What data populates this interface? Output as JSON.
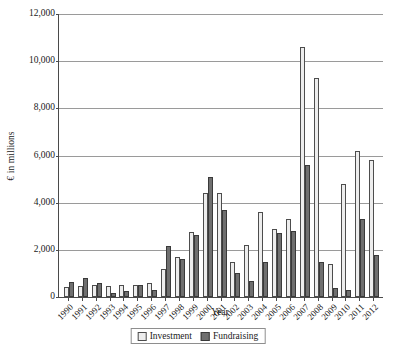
{
  "chart_data": {
    "type": "bar",
    "title": "",
    "xlabel": "Year",
    "ylabel": "€ in millions",
    "ylim": [
      0,
      12000
    ],
    "ytick_step": 2000,
    "yticks": [
      "12,000",
      "10,000",
      "8,000",
      "6,000",
      "4,000",
      "2,000",
      "0"
    ],
    "ytick_values": [
      12000,
      10000,
      8000,
      6000,
      4000,
      2000,
      0
    ],
    "grid": "horizontal",
    "legend_position": "bottom-center",
    "categories": [
      "1990",
      "1991",
      "1992",
      "1993",
      "1994",
      "1995",
      "1996",
      "1997",
      "1998",
      "1999",
      "2000",
      "2001",
      "2002",
      "2003",
      "2004",
      "2005",
      "2006",
      "2007",
      "2008",
      "2009",
      "2010",
      "2011",
      "2012"
    ],
    "series": [
      {
        "name": "Investment",
        "color": "#ededed",
        "values": [
          430,
          480,
          520,
          480,
          520,
          520,
          600,
          1200,
          1700,
          2750,
          4400,
          4400,
          1500,
          2200,
          3600,
          2900,
          3300,
          10600,
          9300,
          1400,
          4800,
          6200,
          5800
        ]
      },
      {
        "name": "Fundraising",
        "color": "#6f6f6f",
        "values": [
          630,
          790,
          600,
          180,
          260,
          520,
          300,
          2150,
          1600,
          2650,
          5100,
          3700,
          1000,
          700,
          1500,
          2700,
          2800,
          5600,
          1500,
          400,
          300,
          3300,
          1800
        ]
      }
    ]
  },
  "legend": {
    "items": [
      {
        "label": "Investment"
      },
      {
        "label": "Fundraising"
      }
    ]
  }
}
